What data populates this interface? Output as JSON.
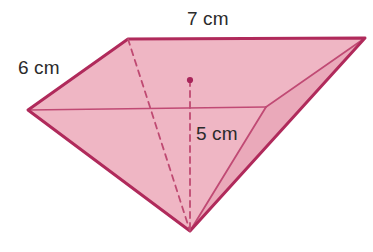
{
  "figure": {
    "name": "rectangular-pyramid",
    "style": {
      "fill_color": "#efb6c4",
      "fill_color_shaded": "#eaa9ba",
      "stroke_color": "#b02a5b",
      "interior_line_color": "#c04a74",
      "dashed_line_color": "#bf4a72",
      "label_color": "#2b2b2b",
      "background": "#ffffff"
    },
    "labels": {
      "base_length": "7 cm",
      "base_width": "6 cm",
      "height": "5 cm"
    },
    "vertices": {
      "base_back_left": {
        "x": 128,
        "y": 39
      },
      "base_back_right": {
        "x": 365,
        "y": 38
      },
      "base_front_left": {
        "x": 28,
        "y": 110
      },
      "base_front_right": {
        "x": 266,
        "y": 107
      },
      "apex": {
        "x": 190,
        "y": 231
      },
      "base_center": {
        "x": 190,
        "y": 80
      }
    },
    "edges": [
      {
        "name": "base-back-edge",
        "from": "base_back_left",
        "to": "base_back_right",
        "style": "solid"
      },
      {
        "name": "base-left-edge",
        "from": "base_back_left",
        "to": "base_front_left",
        "style": "solid"
      },
      {
        "name": "base-front-edge",
        "from": "base_front_left",
        "to": "base_front_right",
        "style": "solid"
      },
      {
        "name": "base-right-edge",
        "from": "base_front_right",
        "to": "base_back_right",
        "style": "solid"
      },
      {
        "name": "lateral-edge-front-left",
        "from": "base_front_left",
        "to": "apex",
        "style": "solid"
      },
      {
        "name": "lateral-edge-front-right",
        "from": "base_front_right",
        "to": "apex",
        "style": "solid"
      },
      {
        "name": "lateral-edge-back-right",
        "from": "base_back_right",
        "to": "apex",
        "style": "solid"
      },
      {
        "name": "lateral-edge-back-left",
        "from": "base_back_left",
        "to": "apex",
        "style": "dashed"
      },
      {
        "name": "height-segment",
        "from": "base_center",
        "to": "apex",
        "style": "dashed"
      }
    ]
  }
}
